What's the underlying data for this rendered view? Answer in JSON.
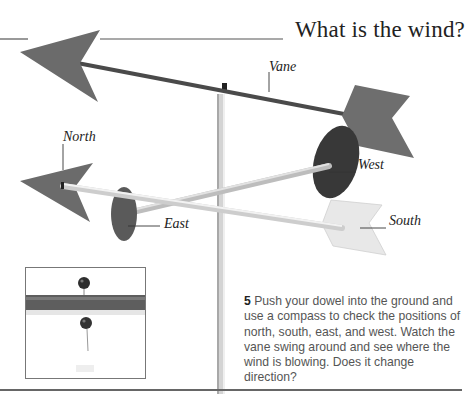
{
  "page": {
    "heading": "What is the wind?"
  },
  "illustration": {
    "title": "Weather vane model",
    "labels": {
      "vane": "Vane",
      "north": "North",
      "west": "West",
      "east": "East",
      "south": "South"
    },
    "colors": {
      "arrow_dark": "#6b6b6b",
      "disk_dark": "#3a3a3a",
      "disk_mid": "#585858",
      "south_arrow": "#e6e6e6",
      "rod_light": "#e8e8e8",
      "rod_dark": "#4a4a4a",
      "pole": "#cfcfcf",
      "rule": "#555555"
    }
  },
  "inset": {
    "description": "Close-up of dowel with pins",
    "colors": {
      "dowel": "#5a5a5a",
      "pin_head": "#2e2e2e"
    }
  },
  "caption": {
    "step_number": "5",
    "text": "Push your dowel into the ground and use a compass to check the positions of north, south, east, and west. Watch the vane swing around and see where the wind is blowing. Does it change direction?"
  }
}
